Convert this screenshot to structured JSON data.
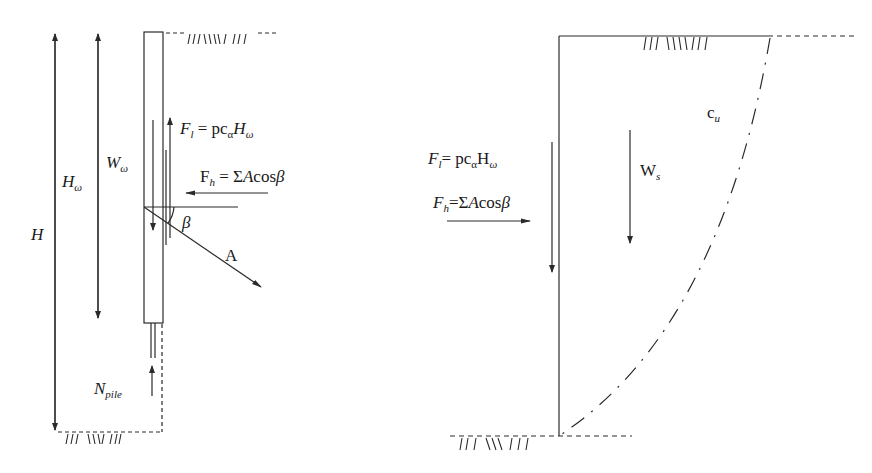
{
  "left_diagram": {
    "labels": {
      "H": "H",
      "H_omega_main": "H",
      "H_omega_sub": "ω",
      "W_omega_main": "W",
      "W_omega_sub": "ω",
      "Fl_main": "F",
      "Fl_sub": "l",
      "Fl_eq": " = pc",
      "Fl_alpha": "α",
      "Fl_H": "H",
      "Fl_omega": "ω",
      "Fh_main": "F",
      "Fh_sub": "h",
      "Fh_eq": " = Σ",
      "Fh_A": "A",
      "Fh_cos": "cos",
      "Fh_beta": "β",
      "beta": "β",
      "A": "A",
      "Npile_main": "N",
      "Npile_sub": "pile"
    }
  },
  "right_diagram": {
    "labels": {
      "Fl_main": "F",
      "Fl_sub": "l",
      "Fl_eq": "= pc",
      "Fl_alpha": "α",
      "Fl_H": "H",
      "Fl_omega": "ω",
      "Fh_main": "F",
      "Fh_sub": "h",
      "Fh_eq": "=Σ",
      "Fh_A": "A",
      "Fh_cos": "cos",
      "Fh_beta": "β",
      "Ws_main": "W",
      "Ws_sub": "s",
      "cu_main": "c",
      "cu_sub": "u"
    }
  },
  "colors": {
    "line": "#2a2a2a",
    "background": "#ffffff"
  }
}
